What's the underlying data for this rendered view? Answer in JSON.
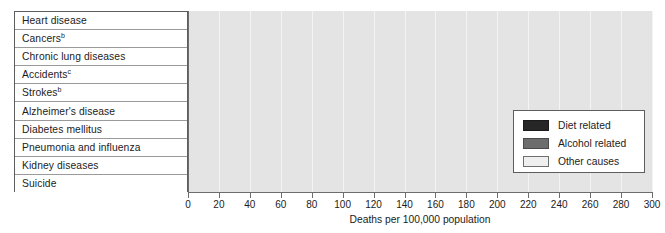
{
  "chart_data": {
    "type": "bar",
    "orientation": "horizontal",
    "title": "",
    "xlabel": "Deaths per 100,000 population",
    "ylabel": "",
    "xlim": [
      0,
      300
    ],
    "xticks": [
      0,
      20,
      40,
      60,
      80,
      100,
      120,
      140,
      160,
      180,
      200,
      220,
      240,
      260,
      280,
      300
    ],
    "grid": true,
    "grid_axis": "x",
    "legend_position": "inside-right",
    "categories": [
      "Heart disease",
      "Cancers",
      "Chronic lung diseases",
      "Accidents",
      "Strokes",
      "Alzheimer's disease",
      "Diabetes mellitus",
      "Pneumonia and influenza",
      "Kidney diseases",
      "Suicide"
    ],
    "category_footnotes": [
      "",
      "b",
      "",
      "c",
      "b",
      "",
      "",
      "",
      "",
      ""
    ],
    "values": [
      165,
      157,
      41,
      41,
      38,
      26,
      22,
      16,
      15,
      15
    ],
    "point_categories": [
      "Diet related",
      "Diet related",
      "Other causes",
      "Alcohol related",
      "Diet related",
      "Other causes",
      "Diet related",
      "Other causes",
      "Other causes",
      "Other causes"
    ],
    "series": [
      {
        "name": "Diet related",
        "color": "#262626",
        "points": [
          {
            "category": "Heart disease",
            "value": 165
          },
          {
            "category": "Cancers",
            "value": 157
          },
          {
            "category": "Strokes",
            "value": 38
          },
          {
            "category": "Diabetes mellitus",
            "value": 22
          }
        ]
      },
      {
        "name": "Alcohol related",
        "color": "#6d6d6d",
        "points": [
          {
            "category": "Accidents",
            "value": 41
          }
        ]
      },
      {
        "name": "Other causes",
        "color": "#efefef",
        "points": [
          {
            "category": "Chronic lung diseases",
            "value": 41
          },
          {
            "category": "Alzheimer's disease",
            "value": 26
          },
          {
            "category": "Pneumonia and influenza",
            "value": 16
          },
          {
            "category": "Kidney diseases",
            "value": 15
          },
          {
            "category": "Suicide",
            "value": 15
          }
        ]
      }
    ]
  },
  "legend": {
    "items": [
      {
        "label": "Diet related",
        "key": "diet",
        "color": "#262626"
      },
      {
        "label": "Alcohol related",
        "key": "alcohol",
        "color": "#6d6d6d"
      },
      {
        "label": "Other causes",
        "key": "other",
        "color": "#efefef"
      }
    ]
  },
  "colors": {
    "plot_background": "#e4e4e4",
    "gridline": "#f4f4f4",
    "axis": "#6d6d6d",
    "text": "#1c1c1c",
    "table_border": "#5d5d5d",
    "row_divider": "#9a9a9a"
  }
}
